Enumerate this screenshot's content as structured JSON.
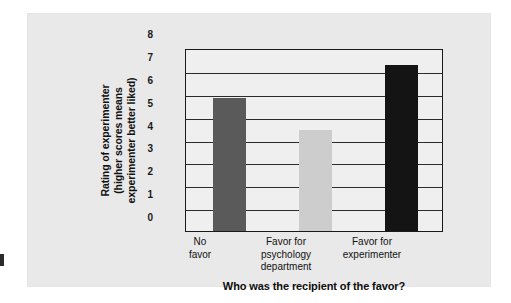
{
  "chart_data": {
    "type": "bar",
    "title": "",
    "subtitle": "",
    "xlabel": "Who was the recipient of the favor?",
    "ylabel": "Rating of experimenter (higher scores means experimenter better liked)",
    "ylabel_lines": [
      "Rating of experimenter",
      "(higher scores means",
      "experimenter better liked)"
    ],
    "categories": [
      "No favor",
      "Favor for psychology department",
      "Favor for experimenter"
    ],
    "category_lines": [
      [
        "No",
        "favor"
      ],
      [
        "Favor for",
        "psychology",
        "department"
      ],
      [
        "Favor for",
        "experimenter"
      ]
    ],
    "values": [
      5.8,
      4.4,
      7.25
    ],
    "bar_colors": [
      "#5a5a5a",
      "#cdcdcd",
      "#141414"
    ],
    "ylim": [
      0,
      8
    ],
    "ytick_values": [
      0,
      1,
      2,
      3,
      4,
      5,
      6,
      7,
      8
    ],
    "ytick_labels": [
      "0",
      "1",
      "2",
      "3",
      "4",
      "5",
      "6",
      "7",
      "8"
    ],
    "grid": true,
    "legend": false,
    "legend_position": "none"
  },
  "figure": {
    "panel_background": "#e9e9e9",
    "plot_background": "#efefef",
    "axis_color": "#1a1a1a",
    "page_background": "#ffffff"
  }
}
